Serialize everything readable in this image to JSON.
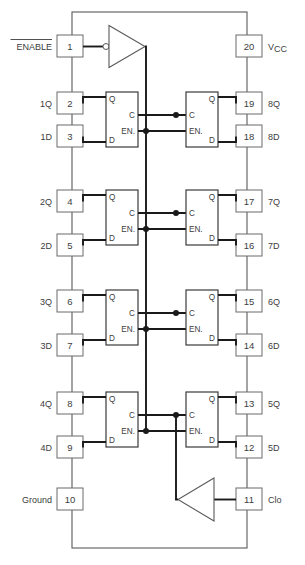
{
  "diagram": {
    "package_pin_count": 20,
    "colors": {
      "wire": "#1a1a1a",
      "outline": "#5a5a5a",
      "text": "#3d3d3d",
      "background": "#ffffff"
    }
  },
  "pins": {
    "left": [
      {
        "number": "1",
        "label": "ENABLE",
        "overbar": true
      },
      {
        "number": "2",
        "label": "1Q",
        "overbar": false
      },
      {
        "number": "3",
        "label": "1D",
        "overbar": false
      },
      {
        "number": "4",
        "label": "2Q",
        "overbar": false
      },
      {
        "number": "5",
        "label": "2D",
        "overbar": false
      },
      {
        "number": "6",
        "label": "3Q",
        "overbar": false
      },
      {
        "number": "7",
        "label": "3D",
        "overbar": false
      },
      {
        "number": "8",
        "label": "4Q",
        "overbar": false
      },
      {
        "number": "9",
        "label": "4D",
        "overbar": false
      },
      {
        "number": "10",
        "label": "Ground",
        "overbar": false
      }
    ],
    "right": [
      {
        "number": "20",
        "label": "V",
        "subscript": "CC"
      },
      {
        "number": "19",
        "label": "8Q",
        "subscript": ""
      },
      {
        "number": "18",
        "label": "8D",
        "subscript": ""
      },
      {
        "number": "17",
        "label": "7Q",
        "subscript": ""
      },
      {
        "number": "16",
        "label": "7D",
        "subscript": ""
      },
      {
        "number": "15",
        "label": "6Q",
        "subscript": ""
      },
      {
        "number": "14",
        "label": "6D",
        "subscript": ""
      },
      {
        "number": "13",
        "label": "5Q",
        "subscript": ""
      },
      {
        "number": "12",
        "label": "5D",
        "subscript": ""
      },
      {
        "number": "11",
        "label": "Clo",
        "subscript": ""
      }
    ]
  },
  "flipflops": {
    "port_q": "Q",
    "port_c": "C",
    "port_en": "EN.",
    "port_d": "D",
    "left_column_count": 4,
    "right_column_count": 4
  },
  "gates": {
    "enable_inverter": "inverter",
    "clock_buffer": "buffer"
  }
}
